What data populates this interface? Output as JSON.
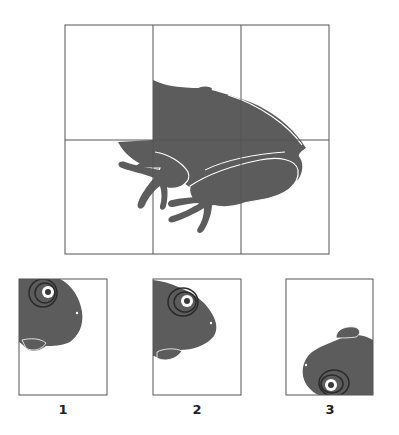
{
  "puzzle": {
    "description": "Frog image grid with a missing head piece; choose the correct fragment",
    "grid": {
      "columns": 3,
      "rows": 2,
      "missing_cells": [
        "row1-col1",
        "row2-col1"
      ]
    },
    "colors": {
      "fill": "#5c5c5c",
      "outline": "#555555",
      "grid_line": "#555555",
      "background": "#ffffff",
      "highlight": "#ffffff"
    }
  },
  "options": [
    {
      "label": "1",
      "description": "frog head, eye upper-left, facing right"
    },
    {
      "label": "2",
      "description": "frog head, eye upper-middle, facing right"
    },
    {
      "label": "3",
      "description": "frog head rotated, eye at bottom"
    }
  ]
}
